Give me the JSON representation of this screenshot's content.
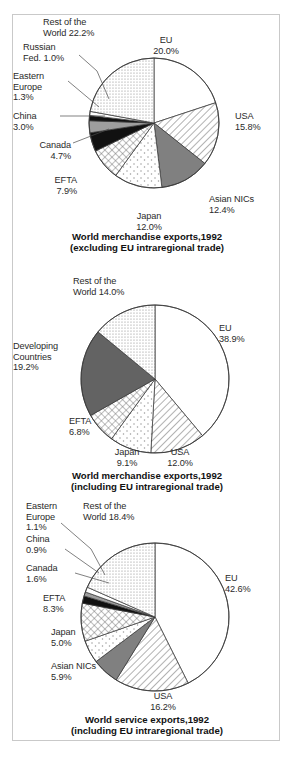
{
  "figure": {
    "background": "#ffffff",
    "border_color": "#c9c9c9",
    "text_color": "#2a2a2a"
  },
  "chart_data": [
    {
      "id": "chart1",
      "type": "pie",
      "title": "World merchandise exports,1992\n(excluding EU intraregional trade)",
      "title_line1": "World merchandise exports,1992",
      "title_line2": "(excluding EU intraregional trade)",
      "xlabel": "",
      "ylabel": "",
      "legend": "none (direct labels with leader lines)",
      "start_angle_deg": 0,
      "direction": "clockwise",
      "categories": [
        "EU",
        "USA",
        "Asian NICs",
        "Japan",
        "EFTA",
        "Canada",
        "China",
        "Eastern Europe",
        "Russian Fed.",
        "Rest of the World"
      ],
      "values": [
        20.0,
        15.8,
        12.4,
        12.0,
        7.9,
        4.7,
        3.0,
        1.3,
        1.0,
        22.2
      ],
      "labels": [
        {
          "name": "EU",
          "value": "20.0%",
          "text": "EU\n20.0%"
        },
        {
          "name": "USA",
          "value": "15.8%",
          "text": "USA\n15.8%"
        },
        {
          "name": "Asian NICs",
          "value": "12.4%",
          "text": "Asian NICs\n12.4%"
        },
        {
          "name": "Japan",
          "value": "12.0%",
          "text": "Japan\n12.0%"
        },
        {
          "name": "EFTA",
          "value": "7.9%",
          "text": "EFTA\n7.9%"
        },
        {
          "name": "Canada",
          "value": "4.7%",
          "text": "Canada\n4.7%"
        },
        {
          "name": "China",
          "value": "3.0%",
          "text": "China\n3.0%"
        },
        {
          "name": "Eastern Europe",
          "value": "1.3%",
          "text": "Eastern\nEurope\n1.3%"
        },
        {
          "name": "Russian Fed.",
          "value": "1.0%",
          "text": "Russian\nFed. 1.0%"
        },
        {
          "name": "Rest of the World",
          "value": "22.2%",
          "text": "Rest of the\nWorld 22.2%"
        }
      ],
      "fills": [
        "white",
        "diagonal-hatch",
        "solid-gray",
        "sparse-dots",
        "crosshatch",
        "black",
        "mid-gray",
        "black",
        "white",
        "fine-dots"
      ]
    },
    {
      "id": "chart2",
      "type": "pie",
      "title": "World merchandise exports,1992\n(including EU intraregional trade)",
      "title_line1": "World merchandise exports,1992",
      "title_line2": "(including EU intraregional trade)",
      "xlabel": "",
      "ylabel": "",
      "legend": "none (direct labels)",
      "start_angle_deg": 0,
      "direction": "clockwise",
      "categories": [
        "EU",
        "USA",
        "Japan",
        "EFTA",
        "Developing Countries",
        "Rest of the World"
      ],
      "values": [
        38.9,
        12.0,
        9.1,
        6.8,
        19.2,
        14.0
      ],
      "labels": [
        {
          "name": "EU",
          "value": "38.9%",
          "text": "EU\n38.9%"
        },
        {
          "name": "USA",
          "value": "12.0%",
          "text": "USA\n12.0%"
        },
        {
          "name": "Japan",
          "value": "9.1%",
          "text": "Japan\n9.1%"
        },
        {
          "name": "EFTA",
          "value": "6.8%",
          "text": "EFTA\n6.8%"
        },
        {
          "name": "Developing Countries",
          "value": "19.2%",
          "text": "Developing\nCountries\n19.2%"
        },
        {
          "name": "Rest of the World",
          "value": "14.0%",
          "text": "Rest of the\nWorld 14.0%"
        }
      ],
      "fills": [
        "white",
        "diagonal-hatch",
        "sparse-dots",
        "crosshatch",
        "solid-darkgray",
        "fine-dots"
      ]
    },
    {
      "id": "chart3",
      "type": "pie",
      "title": "World service exports,1992\n(including EU intraregional trade)",
      "title_line1": "World service exports,1992",
      "title_line2": "(including EU intraregional trade)",
      "xlabel": "",
      "ylabel": "",
      "legend": "none (direct labels with leader lines)",
      "start_angle_deg": 0,
      "direction": "clockwise",
      "categories": [
        "EU",
        "USA",
        "Asian NICs",
        "Japan",
        "EFTA",
        "Canada",
        "China",
        "Eastern Europe",
        "Rest of the World"
      ],
      "values": [
        42.6,
        16.2,
        5.9,
        5.0,
        8.3,
        1.6,
        0.9,
        1.1,
        18.4
      ],
      "labels": [
        {
          "name": "EU",
          "value": "42.6%",
          "text": "EU\n42.6%"
        },
        {
          "name": "USA",
          "value": "16.2%",
          "text": "USA\n16.2%"
        },
        {
          "name": "Asian NICs",
          "value": "5.9%",
          "text": "Asian NICs\n5.9%"
        },
        {
          "name": "Japan",
          "value": "5.0%",
          "text": "Japan\n5.0%"
        },
        {
          "name": "EFTA",
          "value": "8.3%",
          "text": "EFTA\n8.3%"
        },
        {
          "name": "Canada",
          "value": "1.6%",
          "text": "Canada\n1.6%"
        },
        {
          "name": "China",
          "value": "0.9%",
          "text": "China\n0.9%"
        },
        {
          "name": "Eastern Europe",
          "value": "1.1%",
          "text": "Eastern\nEurope\n1.1%"
        },
        {
          "name": "Rest of the World",
          "value": "18.4%",
          "text": "Rest of the\nWorld 18.4%"
        }
      ],
      "fills": [
        "white",
        "diagonal-hatch",
        "solid-gray",
        "sparse-dots",
        "crosshatch",
        "black",
        "mid-gray",
        "white",
        "fine-dots"
      ]
    }
  ]
}
